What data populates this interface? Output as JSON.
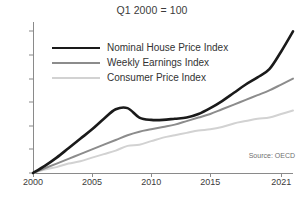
{
  "chart_data": {
    "type": "line",
    "title": "",
    "subtitle": "Q1 2000 = 100",
    "xlabel": "",
    "ylabel": "",
    "xlim": [
      2000,
      2022
    ],
    "ylim": [
      100,
      228
    ],
    "xticks": [
      2000,
      2005,
      2010,
      2015,
      2021
    ],
    "yticks": [
      100,
      120,
      140,
      160,
      180,
      200,
      220
    ],
    "grid": false,
    "legend_position": "top-left",
    "source_note": "Source: OECD",
    "series": [
      {
        "name": "Nominal House Price Index",
        "color": "#1a1a1a",
        "width": 2.6,
        "x": [
          2000,
          2001,
          2002,
          2003,
          2004,
          2005,
          2006,
          2007,
          2008,
          2009,
          2010,
          2011,
          2012,
          2013,
          2014,
          2015,
          2016,
          2017,
          2018,
          2019,
          2020,
          2021,
          2022
        ],
        "values": [
          100,
          106,
          113,
          121,
          129,
          137,
          146,
          154,
          155,
          147,
          145,
          145,
          146,
          147,
          150,
          155,
          161,
          168,
          175,
          181,
          188,
          203,
          220
        ]
      },
      {
        "name": "Weekly Earnings Index",
        "color": "#8c8c8c",
        "width": 2.0,
        "x": [
          2000,
          2001,
          2002,
          2003,
          2004,
          2005,
          2006,
          2007,
          2008,
          2009,
          2010,
          2011,
          2012,
          2013,
          2014,
          2015,
          2016,
          2017,
          2018,
          2019,
          2020,
          2021,
          2022
        ],
        "values": [
          100,
          104,
          108,
          112,
          116,
          120,
          124,
          128,
          132,
          135,
          137,
          139,
          141,
          144,
          147,
          150,
          154,
          158,
          162,
          166,
          170,
          175,
          180
        ]
      },
      {
        "name": "Consumer Price Index",
        "color": "#d2d2d2",
        "width": 2.0,
        "x": [
          2000,
          2001,
          2002,
          2003,
          2004,
          2005,
          2006,
          2007,
          2008,
          2009,
          2010,
          2011,
          2012,
          2013,
          2014,
          2015,
          2016,
          2017,
          2018,
          2019,
          2020,
          2021,
          2022
        ],
        "values": [
          100,
          103,
          105,
          108,
          110,
          113,
          116,
          119,
          123,
          124,
          127,
          130,
          132,
          134,
          136,
          137,
          139,
          142,
          144,
          146,
          147,
          150,
          153
        ]
      }
    ]
  }
}
